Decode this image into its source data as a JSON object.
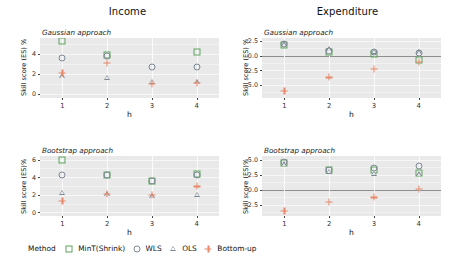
{
  "figure": {
    "column_titles": [
      "Income",
      "Expenditure"
    ],
    "x_axis_label": "h",
    "y_axis_label": "Skill score (ES) %"
  },
  "legend": {
    "title": "Method",
    "entries": [
      {
        "label": "MinT(Shrink)",
        "shape": "square",
        "color": "#5fa35f",
        "name": "legend-item-mint-shrink"
      },
      {
        "label": "WLS",
        "shape": "circle",
        "color": "#7c8896",
        "name": "legend-item-wls"
      },
      {
        "label": "OLS",
        "shape": "triangle",
        "color": "#7c8896",
        "name": "legend-item-ols"
      },
      {
        "label": "Bottom-up",
        "shape": "plus",
        "color": "#e8876a",
        "name": "legend-item-bottom-up"
      }
    ]
  },
  "chart_data": [
    {
      "type": "scatter",
      "panel": "top-left",
      "title": "Income",
      "subtitle": "Gaussian approach",
      "xlabel": "h",
      "ylabel": "Skill score (ES) %",
      "x": [
        1,
        2,
        3,
        4
      ],
      "xticklabels": [
        "1",
        "2",
        "3",
        "4"
      ],
      "ylim": [
        -0.45,
        5.6
      ],
      "yticks": [
        0,
        2,
        4
      ],
      "yticklabels": [
        "0",
        "2",
        "4"
      ],
      "grid": true,
      "zero_line": false,
      "series": [
        {
          "name": "MinT(Shrink)",
          "shape": "square",
          "color": "#5fa35f",
          "values": [
            5.25,
            3.85,
            null,
            4.15
          ]
        },
        {
          "name": "WLS",
          "shape": "circle",
          "color": "#7c8896",
          "values": [
            3.55,
            3.8,
            2.65,
            2.65
          ]
        },
        {
          "name": "OLS",
          "shape": "triangle",
          "color": "#7c8896",
          "values": [
            1.75,
            1.6,
            1.2,
            1.15
          ]
        },
        {
          "name": "Bottom-up",
          "shape": "plus",
          "color": "#e8876a",
          "values": [
            2.1,
            3.1,
            1.0,
            1.1
          ]
        }
      ]
    },
    {
      "type": "scatter",
      "panel": "top-right",
      "title": "Expenditure",
      "subtitle": "Gaussian approach",
      "xlabel": "h",
      "ylabel": "Skill score (ES) %",
      "x": [
        1,
        2,
        3,
        4
      ],
      "xticklabels": [
        "1",
        "2",
        "3",
        "4"
      ],
      "ylim": [
        -7.2,
        3.0
      ],
      "yticks": [
        2.5,
        0.0,
        -2.5,
        -5.0
      ],
      "yticklabels": [
        "2.5",
        "0.0",
        "-2.5",
        "-5.0"
      ],
      "grid": true,
      "zero_line": true,
      "series": [
        {
          "name": "MinT(Shrink)",
          "shape": "square",
          "color": "#5fa35f",
          "values": [
            1.85,
            0.7,
            0.35,
            -0.75
          ]
        },
        {
          "name": "WLS",
          "shape": "circle",
          "color": "#7c8896",
          "values": [
            1.9,
            0.75,
            0.55,
            0.5
          ]
        },
        {
          "name": "OLS",
          "shape": "triangle",
          "color": "#7c8896",
          "values": [
            1.95,
            1.05,
            0.7,
            0.6
          ]
        },
        {
          "name": "Bottom-up",
          "shape": "plus",
          "color": "#e8876a",
          "values": [
            -6.0,
            -3.7,
            -2.3,
            -1.05
          ]
        }
      ]
    },
    {
      "type": "scatter",
      "panel": "bottom-left",
      "title": "Income",
      "subtitle": "Bootstrap approach",
      "xlabel": "h",
      "ylabel": "Skill score (ES)%",
      "x": [
        1,
        2,
        3,
        4
      ],
      "xticklabels": [
        "1",
        "2",
        "3",
        "4"
      ],
      "ylim": [
        -0.4,
        6.4
      ],
      "yticks": [
        0,
        2,
        4,
        6
      ],
      "yticklabels": [
        "0",
        "2",
        "4",
        "6"
      ],
      "grid": true,
      "zero_line": false,
      "series": [
        {
          "name": "MinT(Shrink)",
          "shape": "square",
          "color": "#5fa35f",
          "values": [
            5.95,
            4.3,
            3.6,
            4.35
          ]
        },
        {
          "name": "WLS",
          "shape": "circle",
          "color": "#7c8896",
          "values": [
            4.2,
            4.25,
            3.55,
            4.25
          ]
        },
        {
          "name": "OLS",
          "shape": "triangle",
          "color": "#7c8896",
          "values": [
            2.25,
            2.05,
            1.85,
            2.0
          ]
        },
        {
          "name": "Bottom-up",
          "shape": "plus",
          "color": "#e8876a",
          "values": [
            1.3,
            2.1,
            1.95,
            2.95
          ]
        }
      ]
    },
    {
      "type": "scatter",
      "panel": "bottom-right",
      "title": "Expenditure",
      "subtitle": "Bootstrap approach",
      "xlabel": "h",
      "ylabel": "Skill score (ES)%",
      "x": [
        1,
        2,
        3,
        4
      ],
      "xticklabels": [
        "1",
        "2",
        "3",
        "4"
      ],
      "ylim": [
        -4.4,
        5.6
      ],
      "yticks": [
        5.0,
        2.5,
        0.0,
        -2.5
      ],
      "yticklabels": [
        "5.0",
        "2.5",
        "0.0",
        "-2.5"
      ],
      "grid": true,
      "zero_line": true,
      "series": [
        {
          "name": "MinT(Shrink)",
          "shape": "square",
          "color": "#5fa35f",
          "values": [
            4.5,
            3.3,
            3.25,
            2.7
          ]
        },
        {
          "name": "WLS",
          "shape": "circle",
          "color": "#7c8896",
          "values": [
            4.55,
            3.35,
            3.65,
            3.9
          ]
        },
        {
          "name": "OLS",
          "shape": "triangle",
          "color": "#7c8896",
          "values": [
            4.2,
            2.95,
            2.65,
            2.6
          ]
        },
        {
          "name": "Bottom-up",
          "shape": "plus",
          "color": "#e8876a",
          "values": [
            -3.5,
            -2.1,
            -1.3,
            0.1
          ]
        }
      ]
    }
  ]
}
